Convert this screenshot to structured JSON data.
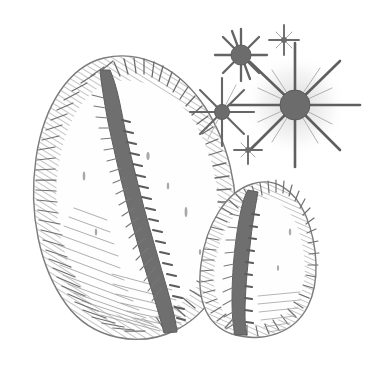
{
  "artwork": {
    "title": "Two Cowrie Shells with Star Cluster",
    "medium": "pen-and-ink engraving / hatched line illustration",
    "subject": "cowrie seashells",
    "background_color": "#ffffff",
    "ink_color": "#6e6e6e",
    "ink_dark_color": "#5a5a5a",
    "ink_light_color": "#9a9a9a",
    "canvas": {
      "width": 384,
      "height": 370
    }
  },
  "elements": {
    "large_shell": {
      "name": "Large cowrie shell",
      "position": "left",
      "bounds": {
        "x": 30,
        "y": 55,
        "width": 210,
        "height": 285
      },
      "aperture_label": "dark scalloped aperture slit",
      "texture": "radiating comb hatching along dorsal margins"
    },
    "small_shell": {
      "name": "Small cowrie shell",
      "position": "right",
      "bounds": {
        "x": 185,
        "y": 180,
        "width": 135,
        "height": 155
      },
      "aperture_label": "dark scalloped aperture slit",
      "texture": "radiating comb hatching along dorsal margins"
    },
    "star_cluster": {
      "name": "Star / sparkle cluster",
      "position": "upper right",
      "count": 5,
      "stars": [
        {
          "id": "star-large",
          "cx": 295,
          "cy": 105,
          "core_r": 15,
          "rays": 8,
          "ray_length": 62,
          "size": "large"
        },
        {
          "id": "star-medium-upper",
          "cx": 241,
          "cy": 55,
          "core_r": 10,
          "rays": 10,
          "ray_length": 26,
          "size": "medium"
        },
        {
          "id": "star-medium-left",
          "cx": 222,
          "cy": 112,
          "core_r": 7.5,
          "rays": 8,
          "ray_length": 34,
          "size": "medium"
        },
        {
          "id": "star-small-upper",
          "cx": 284,
          "cy": 40,
          "core_r": 3,
          "rays": 4,
          "ray_length": 15,
          "size": "small"
        },
        {
          "id": "star-small-lower",
          "cx": 248,
          "cy": 150,
          "core_r": 3,
          "rays": 4,
          "ray_length": 14,
          "size": "small"
        }
      ]
    }
  }
}
